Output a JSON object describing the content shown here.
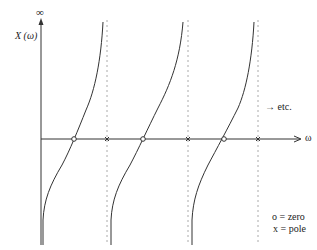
{
  "diagram": {
    "type": "reactance-function-plot",
    "y_axis": {
      "label": "X (ω)",
      "top_label": "∞"
    },
    "x_axis": {
      "label": "ω"
    },
    "continuation_label": "→ etc.",
    "legend": [
      {
        "symbol": "o",
        "text": "o = zero"
      },
      {
        "symbol": "x",
        "text": "x = pole"
      }
    ],
    "zeros_x_px": [
      74,
      143,
      224
    ],
    "poles_x_px": [
      107,
      188,
      258
    ],
    "colors": {
      "line": "#333333",
      "dotted": "#aaaaaa",
      "background": "#ffffff"
    }
  }
}
